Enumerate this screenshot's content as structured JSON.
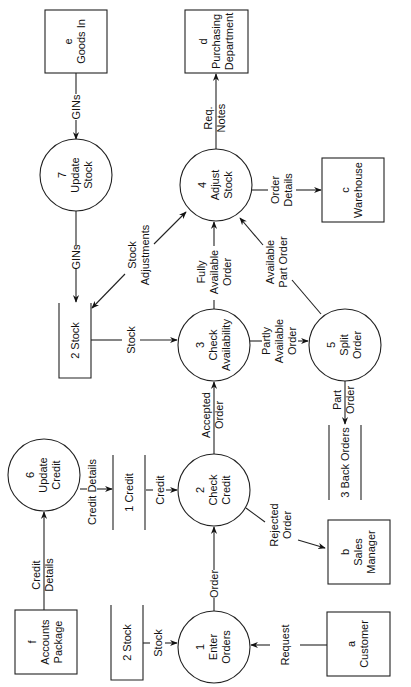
{
  "diagram": {
    "type": "data-flow-diagram",
    "orientation": "rotated-90-ccw",
    "external_entities": [
      {
        "id": "e",
        "letter": "e",
        "name": "Goods In"
      },
      {
        "id": "d",
        "letter": "d",
        "name_line1": "Purchasing",
        "name_line2": "Department"
      },
      {
        "id": "c",
        "letter": "c",
        "name": "Warehouse"
      },
      {
        "id": "b",
        "letter": "b",
        "name_line1": "Sales",
        "name_line2": "Manager"
      },
      {
        "id": "f",
        "letter": "f",
        "name_line1": "Accounts",
        "name_line2": "Package"
      },
      {
        "id": "a",
        "letter": "a",
        "name": "Customer"
      }
    ],
    "processes": [
      {
        "number": "7",
        "line1": "Update",
        "line2": "Stock"
      },
      {
        "number": "4",
        "line1": "Adjust",
        "line2": "Stock"
      },
      {
        "number": "3",
        "line1": "Check",
        "line2": "Availability"
      },
      {
        "number": "5",
        "line1": "Split",
        "line2": "Order"
      },
      {
        "number": "6",
        "line1": "Update",
        "line2": "Credit"
      },
      {
        "number": "2",
        "line1": "Check",
        "line2": "Credit"
      },
      {
        "number": "1",
        "line1": "Enter",
        "line2": "Orders"
      }
    ],
    "data_stores": [
      {
        "label": "2 Stock",
        "position": "top"
      },
      {
        "label": "1 Credit"
      },
      {
        "label": "3 Back Orders"
      },
      {
        "label": "2 Stock",
        "position": "bottom"
      }
    ],
    "flows": {
      "gins_in": "GINs",
      "gins_store": "GINs",
      "req_notes_1": "Req.",
      "req_notes_2": "Notes",
      "order_details_1": "Order",
      "order_details_2": "Details",
      "stock_adjustments_1": "Stock",
      "stock_adjustments_2": "Adjustments",
      "stock_to_check": "Stock",
      "fully_available_1": "Fully",
      "fully_available_2": "Available",
      "fully_available_3": "Order",
      "available_part_1": "Available",
      "available_part_2": "Part Order",
      "partly_available_1": "Partly",
      "partly_available_2": "Available",
      "partly_available_3": "Order",
      "part_order_1": "Part",
      "part_order_2": "Order",
      "credit_details_acc_1": "Credit",
      "credit_details_acc_2": "Details",
      "credit_details_store": "Credit Details",
      "credit": "Credit",
      "accepted_order_1": "Accepted",
      "accepted_order_2": "Order",
      "rejected_order_1": "Rejected",
      "rejected_order_2": "Order",
      "order": "Order",
      "stock_to_enter": "Stock",
      "request": "Request"
    }
  }
}
